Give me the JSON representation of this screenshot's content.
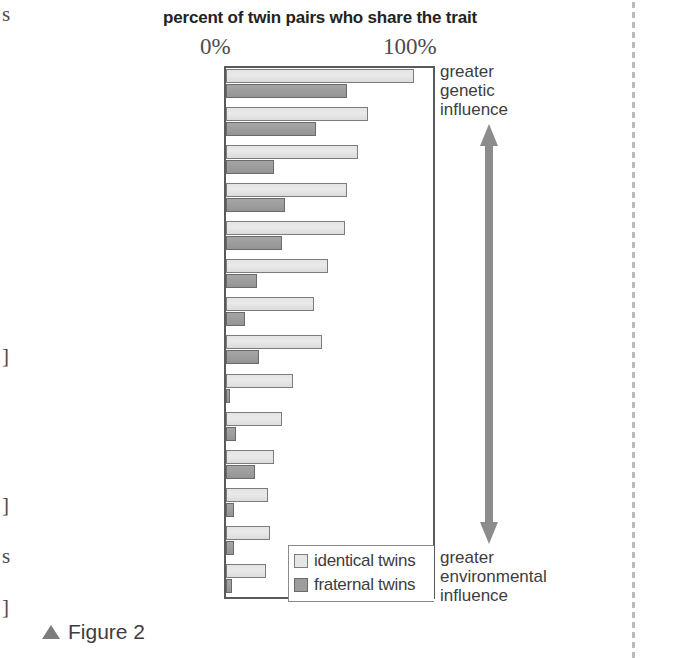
{
  "figure": {
    "caption": "Figure 2",
    "caption_marker_icon": "triangle-up-icon"
  },
  "page_edge": {
    "marks": [
      {
        "glyph": "s",
        "top": 4
      },
      {
        "glyph": "]",
        "top": 346
      },
      {
        "glyph": "]",
        "top": 495
      },
      {
        "glyph": "s",
        "top": 546
      },
      {
        "glyph": "]",
        "top": 597
      }
    ]
  },
  "annotations": {
    "top_line1": "greater",
    "top_line2": "genetic",
    "top_line3": "influence",
    "bottom_line1": "greater",
    "bottom_line2": "environmental",
    "bottom_line3": "influence",
    "arrow_icon": "double-headed-vertical-arrow-icon",
    "arrow_color": "#8c8c8c"
  },
  "legend": {
    "items": [
      {
        "label": "identical twins",
        "color": "#e6e6e6",
        "key": "identical"
      },
      {
        "label": "fraternal twins",
        "color": "#9d9d9d",
        "key": "fraternal"
      }
    ]
  },
  "chart_data": {
    "type": "bar",
    "orientation": "horizontal",
    "title": "percent of twin pairs who share the trait",
    "xlabel": "",
    "ylabel": "",
    "xlim": [
      0,
      100
    ],
    "xticks": [
      0,
      100
    ],
    "xticklabels": [
      "0%",
      "100%"
    ],
    "grid": false,
    "legend_position": "inside-bottom-right",
    "categories": [
      "height",
      "reading disability",
      "autism",
      "Alzheimer's",
      "schizophrenia",
      "alcoholism",
      "bipolar disorder",
      "hypertension",
      "diabetes",
      "multiple sclerosis",
      "breast cancer",
      "Crohn's disease",
      "stroke",
      "rheumatoid arthritis"
    ],
    "series": [
      {
        "name": "identical twins",
        "color": "#e6e6e6",
        "values": [
          90,
          68,
          63,
          58,
          57,
          49,
          42,
          46,
          32,
          27,
          23,
          20,
          21,
          19
        ]
      },
      {
        "name": "fraternal twins",
        "color": "#9d9d9d",
        "values": [
          58,
          43,
          23,
          28,
          27,
          15,
          9,
          16,
          2,
          5,
          14,
          4,
          4,
          3
        ]
      }
    ]
  }
}
